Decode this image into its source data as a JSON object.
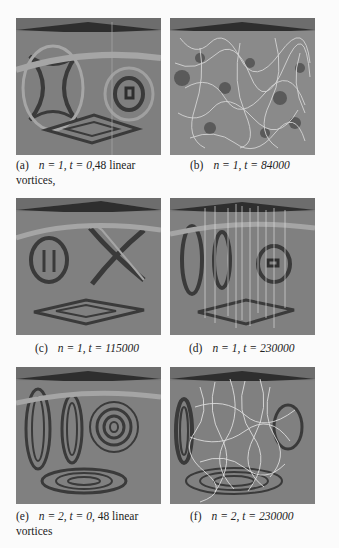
{
  "figure": {
    "panels": [
      {
        "id": "a",
        "label": "(a)",
        "caption_math": "n = 1, t = 0",
        "caption_suffix": ",48 linear",
        "caption_line2": "vortices,",
        "style": "smooth-single-ring"
      },
      {
        "id": "b",
        "label": "(b)",
        "caption_math": "n = 1, t = 84000",
        "caption_suffix": "",
        "caption_line2": "",
        "style": "turbulent-tangle"
      },
      {
        "id": "c",
        "label": "(c)",
        "caption_math": "n = 1, t = 115000",
        "caption_suffix": "",
        "caption_line2": "",
        "style": "x-pattern"
      },
      {
        "id": "d",
        "label": "(d)",
        "caption_math": "n = 1, t = 230000",
        "caption_suffix": "",
        "caption_line2": "",
        "style": "vertical-lines"
      },
      {
        "id": "e",
        "label": "(e)",
        "caption_math": "n = 2, t = 0",
        "caption_suffix": ", 48 linear",
        "caption_line2": "vortices",
        "style": "smooth-double-ring"
      },
      {
        "id": "f",
        "label": "(f)",
        "caption_math": "n = 2, t = 230000",
        "caption_suffix": "",
        "caption_line2": "",
        "style": "tangle-with-rings"
      }
    ],
    "colors": {
      "panel_bg": "#7d7d7d",
      "fringe_dark": "#3a3a3a",
      "fringe_light": "#a8a8a8",
      "top_face": "#2e2e2e",
      "vortex_line": "#d8d8d8"
    }
  }
}
